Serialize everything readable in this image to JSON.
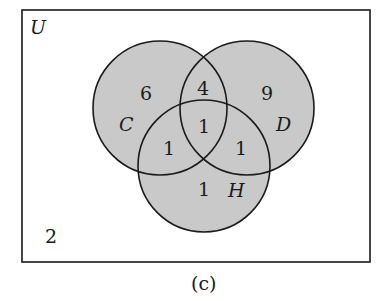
{
  "universe_label": "U",
  "outside_count": "2",
  "caption": "(c)",
  "fill_color": "#c9c9c9",
  "stroke_color": "#1a1a1a",
  "sets": [
    {
      "name": "C",
      "cx": 160,
      "cy": 108,
      "r": 67
    },
    {
      "name": "D",
      "cx": 247,
      "cy": 108,
      "r": 67
    },
    {
      "name": "H",
      "cx": 204,
      "cy": 166,
      "r": 66
    }
  ],
  "regions": {
    "C_only": "6",
    "D_only": "9",
    "H_only": "1",
    "C_and_D_only": "4",
    "C_and_H_only": "1",
    "D_and_H_only": "1",
    "C_D_H": "1"
  }
}
